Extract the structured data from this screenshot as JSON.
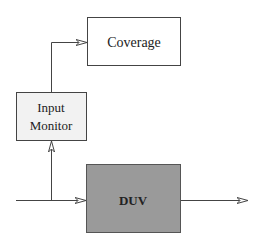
{
  "diagram": {
    "nodes": [
      {
        "id": "coverage",
        "label": "Coverage",
        "fill": "#ffffff"
      },
      {
        "id": "input_monitor",
        "label_line1": "Input",
        "label_line2": "Monitor",
        "fill": "#f2f2f2"
      },
      {
        "id": "duv",
        "label": "DUV",
        "fill": "#9a9a9a"
      }
    ],
    "edges": [
      {
        "from": "input",
        "to": "duv"
      },
      {
        "from": "input",
        "to": "input_monitor"
      },
      {
        "from": "input_monitor",
        "to": "coverage"
      },
      {
        "from": "duv",
        "to": "output"
      }
    ],
    "colors": {
      "stroke": "#444444"
    }
  }
}
